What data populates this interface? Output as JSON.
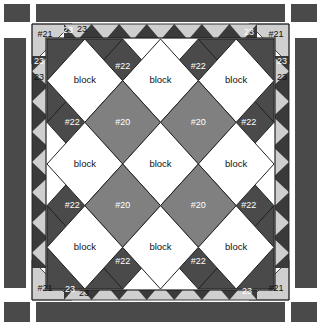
{
  "diagram": {
    "type": "on-point quilt layout diagram"
  },
  "colors": {
    "outer_border": "#4a4a4a",
    "corner_square": "#4a4a4a",
    "sawtooth_background": "#3a3a3a",
    "sawtooth_triangle": "#cfcfcf",
    "corner_triangle_light": "#cfcfcf",
    "setting_triangle_dark": "#4a4a4a",
    "block_white": "#ffffff",
    "alternate_block_gray": "#808080",
    "outline": "#222222",
    "page_background": "#ffffff"
  },
  "labels": {
    "block": "block",
    "alt_block": "#20",
    "corner_triangle": "#21",
    "setting_triangle": "#22",
    "sawtooth_unit": "23"
  },
  "field": {
    "rows": [
      [
        "block",
        "block",
        "block"
      ],
      [
        "#20",
        "#20"
      ],
      [
        "block",
        "block",
        "block"
      ],
      [
        "#20",
        "#20"
      ],
      [
        "block",
        "block",
        "block"
      ]
    ],
    "block_count": 9,
    "alt_block_count": 4
  },
  "borders": {
    "top": {
      "corner_left": "#21",
      "corner_right": "#21",
      "unit_left": "23",
      "unit_right": "23"
    },
    "bottom": {
      "corner_left": "#21",
      "corner_right": "#21",
      "unit_left": "23",
      "unit_right": "23"
    },
    "left": {
      "unit_top": "23",
      "unit_top2": "23"
    },
    "right": {
      "unit_top": "23",
      "unit_top2": "23"
    }
  },
  "setting_triangles": {
    "top": [
      "#22",
      "#22"
    ],
    "bottom": [
      "#22",
      "#22"
    ],
    "left": [
      "#22",
      "#22"
    ],
    "right": [
      "#22",
      "#22"
    ],
    "corners": [
      "#21",
      "#21",
      "#21",
      "#21"
    ]
  }
}
